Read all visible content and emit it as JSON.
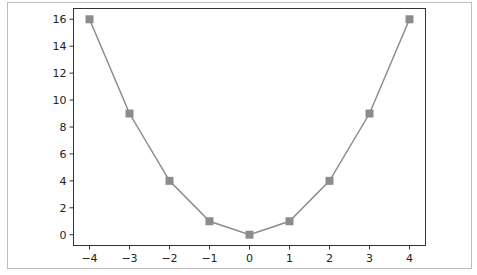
{
  "chart_data": {
    "type": "line",
    "title": "",
    "xlabel": "",
    "ylabel": "",
    "x": [
      -4,
      -3,
      -2,
      -1,
      0,
      1,
      2,
      3,
      4
    ],
    "series": [
      {
        "name": "y = x^2",
        "values": [
          16,
          9,
          4,
          1,
          0,
          1,
          4,
          9,
          16
        ],
        "color": "#8c8c8c",
        "marker": "square"
      }
    ],
    "xlim": [
      -4.4,
      4.4
    ],
    "ylim": [
      -0.8,
      16.8
    ],
    "xticks": [
      -4,
      -3,
      -2,
      -1,
      0,
      1,
      2,
      3,
      4
    ],
    "xtick_labels": [
      "−4",
      "−3",
      "−2",
      "−1",
      "0",
      "1",
      "2",
      "3",
      "4"
    ],
    "yticks": [
      0,
      2,
      4,
      6,
      8,
      10,
      12,
      14,
      16
    ],
    "ytick_labels": [
      "0",
      "2",
      "4",
      "6",
      "8",
      "10",
      "12",
      "14",
      "16"
    ],
    "grid": false,
    "legend": false
  }
}
